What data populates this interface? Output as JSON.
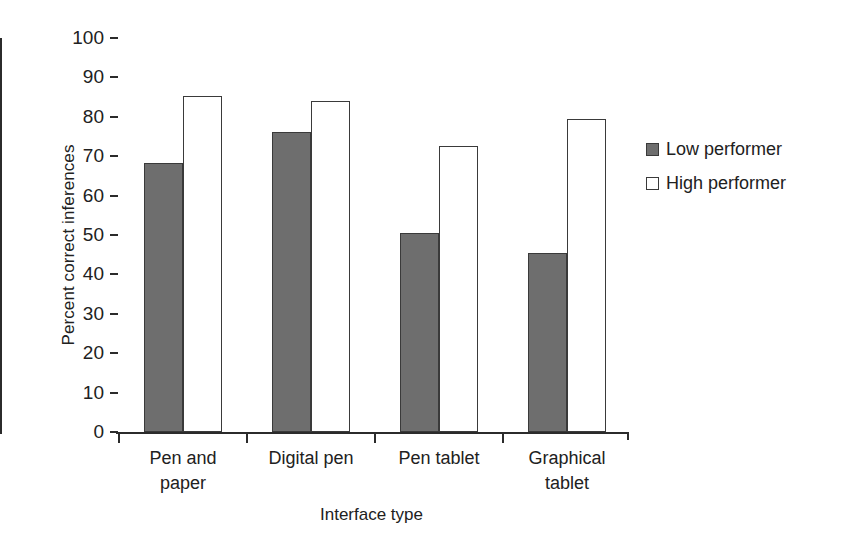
{
  "chart_data": {
    "type": "bar",
    "title": "",
    "xlabel": "Interface type",
    "ylabel": "Percent correct inferences",
    "categories": [
      "Pen and paper",
      "Digital pen",
      "Pen tablet",
      "Graphical tablet"
    ],
    "category_lines": [
      [
        "Pen and",
        "paper"
      ],
      [
        "Digital pen",
        ""
      ],
      [
        "Pen tablet",
        ""
      ],
      [
        "Graphical",
        "tablet"
      ]
    ],
    "series": [
      {
        "name": "Low performer",
        "color": "#6e6e6e",
        "values": [
          68.2,
          76.2,
          50.5,
          45.4
        ]
      },
      {
        "name": "High performer",
        "color": "#ffffff",
        "values": [
          85.3,
          84.0,
          72.7,
          79.5
        ]
      }
    ],
    "ylim": [
      0,
      100
    ],
    "yticks": [
      0,
      10,
      20,
      30,
      40,
      50,
      60,
      70,
      80,
      90,
      100
    ],
    "ytick_labels": [
      "0",
      "10",
      "20",
      "30",
      "40",
      "50",
      "60",
      "70",
      "80",
      "90",
      "100"
    ],
    "grid": false,
    "legend_position": "right"
  },
  "legend": {
    "items": [
      {
        "label": "Low performer",
        "swatch": "filled-gray-square"
      },
      {
        "label": "High performer",
        "swatch": "open-white-square"
      }
    ]
  },
  "axes": {
    "y_title": "Percent correct inferences",
    "x_title": "Interface type"
  }
}
